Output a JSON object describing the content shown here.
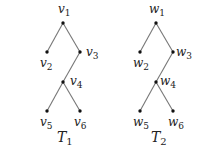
{
  "trees": [
    {
      "name": "T",
      "index": "1",
      "title_pos": [
        57,
        142
      ],
      "nodes": [
        {
          "id": "v1",
          "letter": "v",
          "sub": "1",
          "x": 63,
          "y": 23,
          "lx": 58,
          "ly": 13
        },
        {
          "id": "v2",
          "letter": "v",
          "sub": "2",
          "x": 47,
          "y": 52,
          "lx": 40,
          "ly": 67
        },
        {
          "id": "v3",
          "letter": "v",
          "sub": "3",
          "x": 80,
          "y": 52,
          "lx": 86,
          "ly": 56
        },
        {
          "id": "v4",
          "letter": "v",
          "sub": "4",
          "x": 63,
          "y": 82,
          "lx": 70,
          "ly": 85
        },
        {
          "id": "v5",
          "letter": "v",
          "sub": "5",
          "x": 47,
          "y": 111,
          "lx": 40,
          "ly": 126
        },
        {
          "id": "v6",
          "letter": "v",
          "sub": "6",
          "x": 80,
          "y": 111,
          "lx": 74,
          "ly": 126
        }
      ],
      "edges": [
        [
          "v1",
          "v2"
        ],
        [
          "v1",
          "v3"
        ],
        [
          "v3",
          "v4"
        ],
        [
          "v4",
          "v5"
        ],
        [
          "v4",
          "v6"
        ]
      ]
    },
    {
      "name": "T",
      "index": "2",
      "title_pos": [
        151,
        142
      ],
      "nodes": [
        {
          "id": "w1",
          "letter": "w",
          "sub": "1",
          "x": 156,
          "y": 23,
          "lx": 149,
          "ly": 13
        },
        {
          "id": "w2",
          "letter": "w",
          "sub": "2",
          "x": 140,
          "y": 52,
          "lx": 133,
          "ly": 67
        },
        {
          "id": "w3",
          "letter": "w",
          "sub": "3",
          "x": 173,
          "y": 52,
          "lx": 176,
          "ly": 56
        },
        {
          "id": "w4",
          "letter": "w",
          "sub": "4",
          "x": 156,
          "y": 82,
          "lx": 160,
          "ly": 85
        },
        {
          "id": "w5",
          "letter": "w",
          "sub": "5",
          "x": 140,
          "y": 111,
          "lx": 133,
          "ly": 126
        },
        {
          "id": "w6",
          "letter": "w",
          "sub": "6",
          "x": 173,
          "y": 111,
          "lx": 168,
          "ly": 126
        }
      ],
      "edges": [
        [
          "w1",
          "w2"
        ],
        [
          "w1",
          "w3"
        ],
        [
          "w3",
          "w4"
        ],
        [
          "w4",
          "w5"
        ],
        [
          "w4",
          "w6"
        ]
      ]
    }
  ]
}
